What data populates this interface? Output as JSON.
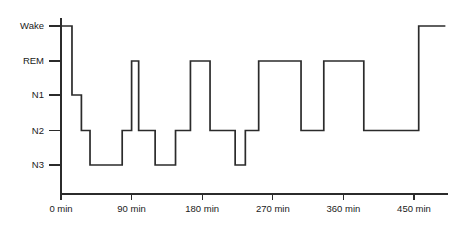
{
  "chart_data": {
    "type": "line",
    "title": "",
    "subtitle": "",
    "xlabel": "",
    "ylabel": "",
    "grid": false,
    "legend": "none",
    "line_style": "step-post",
    "line_color": "#2b2b2b",
    "background_color": "#ffffff",
    "xlim": [
      -10,
      490
    ],
    "xtick_values": [
      0,
      90,
      180,
      270,
      360,
      450
    ],
    "xtick_labels": [
      "0 min",
      "90 min",
      "180 min",
      "270 min",
      "360 min",
      "450 min"
    ],
    "x_unit": "min",
    "ylim_categories": [
      "Wake",
      "REM",
      "N1",
      "N2",
      "N3"
    ],
    "ytick_labels": [
      "Wake",
      "REM",
      "N1",
      "N2",
      "N3"
    ],
    "y_axis_inverted": true,
    "series": [
      {
        "name": "Sleep stage",
        "x": [
          -12,
          14,
          26,
          37,
          78,
          86,
          99,
          109,
          123,
          146,
          168,
          190,
          201,
          222,
          235,
          252,
          276,
          290,
          327,
          353,
          404,
          456,
          490
        ],
        "stages": [
          "Wake",
          "N1",
          "N2",
          "N3",
          "N2",
          "REM",
          "N2",
          "N3",
          "N2",
          "REM",
          "N2",
          "N3",
          "N2",
          "N3",
          "N2",
          "REM",
          "N2",
          "REM",
          "N2",
          "REM",
          "N2",
          "Wake",
          "Wake"
        ],
        "segments": [
          {
            "stage": "Wake",
            "start_min": -12,
            "end_min": 14
          },
          {
            "stage": "N1",
            "start_min": 14,
            "end_min": 26
          },
          {
            "stage": "N2",
            "start_min": 26,
            "end_min": 37
          },
          {
            "stage": "N3",
            "start_min": 37,
            "end_min": 78
          },
          {
            "stage": "N2",
            "start_min": 78,
            "end_min": 90
          },
          {
            "stage": "REM",
            "start_min": 90,
            "end_min": 99
          },
          {
            "stage": "N2",
            "start_min": 99,
            "end_min": 120
          },
          {
            "stage": "N3",
            "start_min": 120,
            "end_min": 146
          },
          {
            "stage": "N2",
            "start_min": 146,
            "end_min": 165
          },
          {
            "stage": "REM",
            "start_min": 165,
            "end_min": 190
          },
          {
            "stage": "N2",
            "start_min": 190,
            "end_min": 222
          },
          {
            "stage": "N3",
            "start_min": 222,
            "end_min": 235
          },
          {
            "stage": "N2",
            "start_min": 235,
            "end_min": 252
          },
          {
            "stage": "REM",
            "start_min": 252,
            "end_min": 306
          },
          {
            "stage": "N2",
            "start_min": 306,
            "end_min": 335
          },
          {
            "stage": "REM",
            "start_min": 335,
            "end_min": 386
          },
          {
            "stage": "N2",
            "start_min": 386,
            "end_min": 456
          },
          {
            "stage": "Wake",
            "start_min": 456,
            "end_min": 490
          }
        ]
      }
    ]
  }
}
